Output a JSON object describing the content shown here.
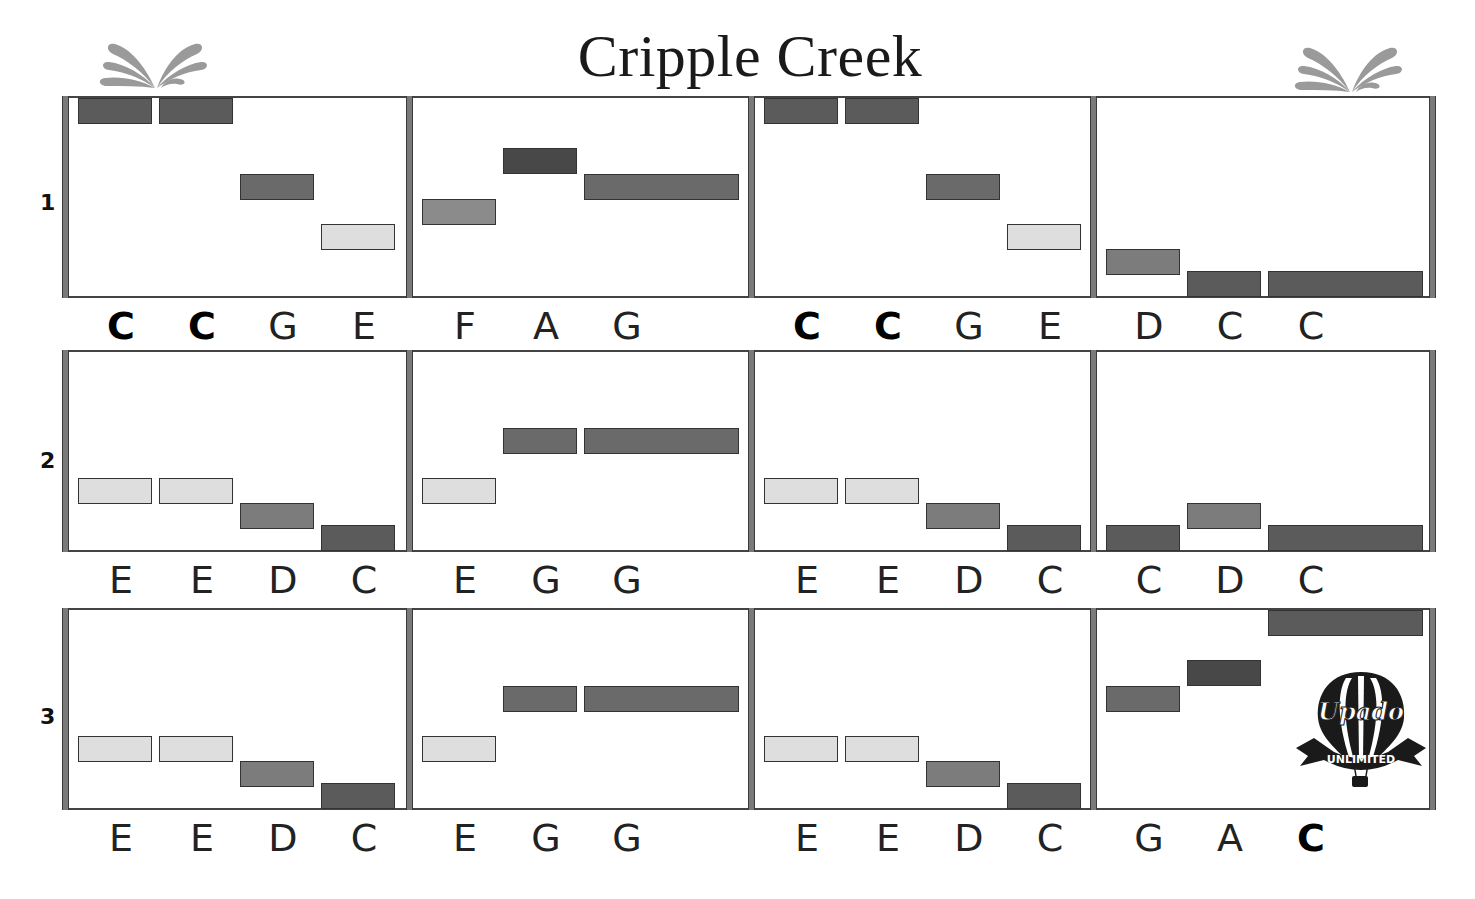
{
  "title": "Cripple Creek",
  "icons": {
    "left_splash": "splash-icon",
    "right_splash": "splash-icon",
    "logo": "hot-air-balloon-logo"
  },
  "logo": {
    "name": "Upado",
    "tagline": "UNLIMITED"
  },
  "colors": {
    "C": "#5b5b5b",
    "C_high": "#5b5b5b",
    "D": "#7c7c7c",
    "E": "#dedede",
    "F": "#8b8b8b",
    "G": "#6a6a6a",
    "A": "#484848",
    "barline": "#7a7a7a",
    "staff_line": "#444444"
  },
  "pitch_levels_top_to_bottom": [
    "C'",
    "B",
    "A",
    "G",
    "F",
    "E",
    "D",
    "C"
  ],
  "rows": [
    {
      "label": "1",
      "measures": [
        {
          "notes": [
            {
              "letter": "C",
              "pitch": "C'",
              "beat": 0,
              "len": 1,
              "bold": true
            },
            {
              "letter": "C",
              "pitch": "C'",
              "beat": 1,
              "len": 1,
              "bold": true
            },
            {
              "letter": "G",
              "pitch": "G",
              "beat": 2,
              "len": 1
            },
            {
              "letter": "E",
              "pitch": "E",
              "beat": 3,
              "len": 1
            }
          ]
        },
        {
          "notes": [
            {
              "letter": "F",
              "pitch": "F",
              "beat": 0,
              "len": 1
            },
            {
              "letter": "A",
              "pitch": "A",
              "beat": 1,
              "len": 1
            },
            {
              "letter": "G",
              "pitch": "G",
              "beat": 2,
              "len": 2
            }
          ]
        },
        {
          "notes": [
            {
              "letter": "C",
              "pitch": "C'",
              "beat": 0,
              "len": 1,
              "bold": true
            },
            {
              "letter": "C",
              "pitch": "C'",
              "beat": 1,
              "len": 1,
              "bold": true
            },
            {
              "letter": "G",
              "pitch": "G",
              "beat": 2,
              "len": 1
            },
            {
              "letter": "E",
              "pitch": "E",
              "beat": 3,
              "len": 1
            }
          ]
        },
        {
          "notes": [
            {
              "letter": "D",
              "pitch": "D",
              "beat": 0,
              "len": 1
            },
            {
              "letter": "C",
              "pitch": "C",
              "beat": 1,
              "len": 1
            },
            {
              "letter": "C",
              "pitch": "C",
              "beat": 2,
              "len": 2
            }
          ]
        }
      ]
    },
    {
      "label": "2",
      "measures": [
        {
          "notes": [
            {
              "letter": "E",
              "pitch": "E",
              "beat": 0,
              "len": 1
            },
            {
              "letter": "E",
              "pitch": "E",
              "beat": 1,
              "len": 1
            },
            {
              "letter": "D",
              "pitch": "D",
              "beat": 2,
              "len": 1
            },
            {
              "letter": "C",
              "pitch": "C",
              "beat": 3,
              "len": 1
            }
          ]
        },
        {
          "notes": [
            {
              "letter": "E",
              "pitch": "E",
              "beat": 0,
              "len": 1
            },
            {
              "letter": "G",
              "pitch": "G",
              "beat": 1,
              "len": 1
            },
            {
              "letter": "G",
              "pitch": "G",
              "beat": 2,
              "len": 2
            }
          ]
        },
        {
          "notes": [
            {
              "letter": "E",
              "pitch": "E",
              "beat": 0,
              "len": 1
            },
            {
              "letter": "E",
              "pitch": "E",
              "beat": 1,
              "len": 1
            },
            {
              "letter": "D",
              "pitch": "D",
              "beat": 2,
              "len": 1
            },
            {
              "letter": "C",
              "pitch": "C",
              "beat": 3,
              "len": 1
            }
          ]
        },
        {
          "notes": [
            {
              "letter": "C",
              "pitch": "C",
              "beat": 0,
              "len": 1
            },
            {
              "letter": "D",
              "pitch": "D",
              "beat": 1,
              "len": 1
            },
            {
              "letter": "C",
              "pitch": "C",
              "beat": 2,
              "len": 2
            }
          ]
        }
      ]
    },
    {
      "label": "3",
      "measures": [
        {
          "notes": [
            {
              "letter": "E",
              "pitch": "E",
              "beat": 0,
              "len": 1
            },
            {
              "letter": "E",
              "pitch": "E",
              "beat": 1,
              "len": 1
            },
            {
              "letter": "D",
              "pitch": "D",
              "beat": 2,
              "len": 1
            },
            {
              "letter": "C",
              "pitch": "C",
              "beat": 3,
              "len": 1
            }
          ]
        },
        {
          "notes": [
            {
              "letter": "E",
              "pitch": "E",
              "beat": 0,
              "len": 1
            },
            {
              "letter": "G",
              "pitch": "G",
              "beat": 1,
              "len": 1
            },
            {
              "letter": "G",
              "pitch": "G",
              "beat": 2,
              "len": 2
            }
          ]
        },
        {
          "notes": [
            {
              "letter": "E",
              "pitch": "E",
              "beat": 0,
              "len": 1
            },
            {
              "letter": "E",
              "pitch": "E",
              "beat": 1,
              "len": 1
            },
            {
              "letter": "D",
              "pitch": "D",
              "beat": 2,
              "len": 1
            },
            {
              "letter": "C",
              "pitch": "C",
              "beat": 3,
              "len": 1
            }
          ]
        },
        {
          "notes": [
            {
              "letter": "G",
              "pitch": "G",
              "beat": 0,
              "len": 1
            },
            {
              "letter": "A",
              "pitch": "A",
              "beat": 1,
              "len": 1
            },
            {
              "letter": "C",
              "pitch": "C'",
              "beat": 2,
              "len": 2,
              "bold": true
            }
          ]
        }
      ]
    }
  ]
}
